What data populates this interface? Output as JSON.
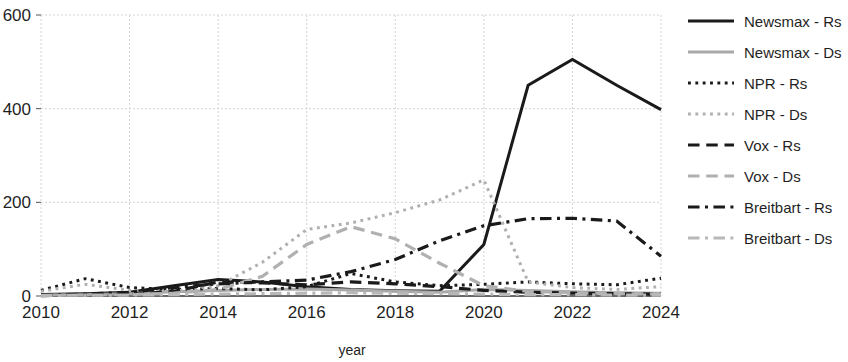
{
  "chart_data": {
    "type": "line",
    "title": "",
    "xlabel": "year",
    "ylabel": "",
    "xlim": [
      2010,
      2024
    ],
    "ylim": [
      0,
      600
    ],
    "xticks": [
      2010,
      2012,
      2014,
      2016,
      2018,
      2020,
      2022,
      2024
    ],
    "yticks": [
      0,
      200,
      400,
      600
    ],
    "grid": true,
    "legend_position": "right",
    "x": [
      2010,
      2011,
      2012,
      2013,
      2014,
      2015,
      2016,
      2017,
      2018,
      2019,
      2020,
      2021,
      2022,
      2023,
      2024
    ],
    "series": [
      {
        "name": "Newsmax - Rs",
        "color": "#1a1a1a",
        "dash": "none",
        "width": 3.0,
        "values": [
          3,
          5,
          8,
          22,
          35,
          30,
          20,
          14,
          11,
          10,
          110,
          450,
          505,
          450,
          398
        ]
      },
      {
        "name": "Newsmax - Ds",
        "color": "#a9a9a9",
        "dash": "none",
        "width": 3.0,
        "values": [
          2,
          3,
          5,
          9,
          12,
          14,
          15,
          13,
          10,
          8,
          14,
          12,
          9,
          7,
          6
        ]
      },
      {
        "name": "NPR - Rs",
        "color": "#1a1a1a",
        "dash": "dotted",
        "width": 3.0,
        "values": [
          12,
          37,
          18,
          14,
          16,
          13,
          20,
          48,
          30,
          22,
          25,
          30,
          26,
          24,
          38
        ]
      },
      {
        "name": "NPR - Ds",
        "color": "#b0b0b0",
        "dash": "dotted",
        "width": 3.0,
        "values": [
          10,
          25,
          12,
          10,
          22,
          72,
          142,
          156,
          178,
          205,
          248,
          30,
          18,
          14,
          20
        ]
      },
      {
        "name": "Vox - Rs",
        "color": "#1a1a1a",
        "dash": "dashed",
        "width": 3.2,
        "values": [
          1,
          2,
          3,
          10,
          30,
          28,
          24,
          30,
          26,
          20,
          12,
          8,
          6,
          5,
          4
        ]
      },
      {
        "name": "Vox - Ds",
        "color": "#b0b0b0",
        "dash": "dashed",
        "width": 3.2,
        "values": [
          1,
          2,
          3,
          6,
          14,
          42,
          110,
          148,
          122,
          70,
          22,
          10,
          7,
          5,
          4
        ]
      },
      {
        "name": "Breitbart - Rs",
        "color": "#1a1a1a",
        "dash": "dashdot",
        "width": 3.2,
        "values": [
          2,
          4,
          8,
          18,
          26,
          30,
          34,
          52,
          78,
          118,
          150,
          165,
          166,
          160,
          85
        ]
      },
      {
        "name": "Breitbart - Ds",
        "color": "#b8b8b8",
        "dash": "dashdot",
        "width": 3.2,
        "values": [
          1,
          2,
          2,
          3,
          4,
          5,
          6,
          7,
          6,
          5,
          4,
          3,
          3,
          2,
          2
        ]
      }
    ]
  },
  "legend": {
    "items": [
      {
        "label": "Newsmax - Rs"
      },
      {
        "label": "Newsmax - Ds"
      },
      {
        "label": "NPR - Rs"
      },
      {
        "label": "NPR - Ds"
      },
      {
        "label": "Vox - Rs"
      },
      {
        "label": "Vox - Ds"
      },
      {
        "label": "Breitbart - Rs"
      },
      {
        "label": "Breitbart - Ds"
      }
    ]
  },
  "axis": {
    "x_title": "year",
    "x_tick_labels": [
      "2010",
      "2012",
      "2014",
      "2016",
      "2018",
      "2020",
      "2022",
      "2024"
    ],
    "y_tick_labels": [
      "0",
      "200",
      "400",
      "600"
    ]
  }
}
